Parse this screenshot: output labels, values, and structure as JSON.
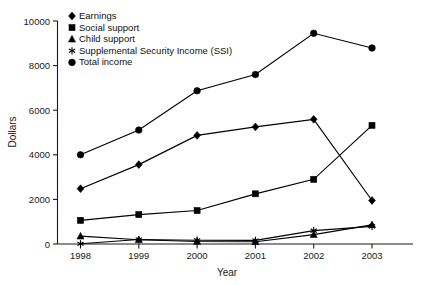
{
  "chart_data": {
    "type": "line",
    "title": "",
    "xlabel": "Year",
    "ylabel": "Dollars",
    "categories": [
      "1998",
      "1999",
      "2000",
      "2001",
      "2002",
      "2003"
    ],
    "x": [
      1998,
      1999,
      2000,
      2001,
      2002,
      2003
    ],
    "xlim": [
      1997.5,
      2003.6
    ],
    "ylim": [
      0,
      10000
    ],
    "ytick_labels": [
      "0",
      "2000",
      "4000",
      "6000",
      "8000",
      "10000"
    ],
    "ytick_values": [
      0,
      2000,
      4000,
      6000,
      8000,
      10000
    ],
    "grid": false,
    "legend_position": "top-left",
    "series": [
      {
        "name": "Earnings",
        "marker": "diamond",
        "values": [
          2480,
          3560,
          4870,
          5250,
          5590,
          1950
        ]
      },
      {
        "name": "Social support",
        "marker": "square",
        "values": [
          1060,
          1320,
          1500,
          2250,
          2900,
          5320
        ]
      },
      {
        "name": "Child support",
        "marker": "triangle",
        "values": [
          350,
          190,
          110,
          100,
          420,
          860
        ]
      },
      {
        "name": "Supplemental Security Income (SSI)",
        "marker": "star",
        "values": [
          10,
          200,
          170,
          160,
          600,
          790
        ]
      },
      {
        "name": "Total income",
        "marker": "circle",
        "values": [
          4000,
          5110,
          6870,
          7600,
          9450,
          8790
        ]
      }
    ]
  },
  "legend": {
    "items": [
      {
        "label": "Earnings",
        "marker": "diamond-marker-icon"
      },
      {
        "label": "Social support",
        "marker": "square-marker-icon"
      },
      {
        "label": "Child support",
        "marker": "triangle-marker-icon"
      },
      {
        "label": "Supplemental Security Income (SSI)",
        "marker": "star-marker-icon"
      },
      {
        "label": "Total income",
        "marker": "circle-marker-icon"
      }
    ]
  },
  "axes": {
    "y_title": "Dollars",
    "x_title": "Year",
    "y_labels": [
      "10000",
      "8000",
      "6000",
      "4000",
      "2000",
      "0"
    ],
    "x_labels": [
      "1998",
      "1999",
      "2000",
      "2001",
      "2002",
      "2003"
    ]
  },
  "colors": {
    "ink": "#000000",
    "background": "#ffffff"
  }
}
